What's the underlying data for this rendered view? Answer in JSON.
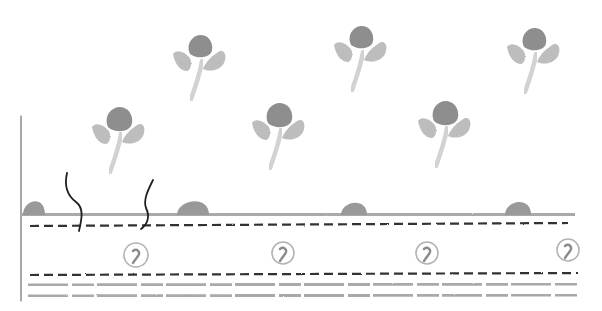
{
  "canvas": {
    "width": 602,
    "height": 311,
    "background": "#ffffff"
  },
  "colors": {
    "pencil_gray": "#a9a9a9",
    "head_gray": "#8e8e8e",
    "leaf_gray": "#bdbdbd",
    "stem_gray": "#d2d2d2",
    "dash_dark": "#333333",
    "wave_dark": "#1f1f1f",
    "ring_gray": "#b3b3b3",
    "mound_gray": "#999999"
  },
  "axis": {
    "x": 21,
    "y_top": 52,
    "y_bottom": 300,
    "gap_y": [
      110,
      117
    ]
  },
  "surface": {
    "y": 214,
    "x_start": 22,
    "x_end": 575
  },
  "band": {
    "top_dash_y": 226,
    "bottom_dash_y": 275,
    "left_x": 30,
    "right_x": 578,
    "left_dash_x": 30
  },
  "bottom_lines": [
    285,
    296
  ],
  "flowers": [
    {
      "cx": 200,
      "cy": 47,
      "r": 12
    },
    {
      "cx": 361,
      "cy": 38,
      "r": 12
    },
    {
      "cx": 534,
      "cy": 40,
      "r": 12
    },
    {
      "cx": 119,
      "cy": 120,
      "r": 13
    },
    {
      "cx": 279,
      "cy": 116,
      "r": 13
    },
    {
      "cx": 445,
      "cy": 114,
      "r": 13
    }
  ],
  "mounds": [
    {
      "cx": 34,
      "w": 22,
      "h": 18
    },
    {
      "cx": 193,
      "w": 32,
      "h": 18
    },
    {
      "cx": 354,
      "w": 26,
      "h": 16
    },
    {
      "cx": 518,
      "w": 26,
      "h": 17
    }
  ],
  "rings": [
    {
      "cx": 136,
      "cy": 255,
      "r": 12
    },
    {
      "cx": 283,
      "cy": 253,
      "r": 11
    },
    {
      "cx": 427,
      "cy": 253,
      "r": 11
    },
    {
      "cx": 568,
      "cy": 250,
      "r": 11
    }
  ],
  "wavy_lines": [
    "M67 173 C64 186, 68 196, 76 202 C84 208, 82 218, 79 231",
    "M153 180 C148 190, 143 200, 146 208 C150 216, 148 224, 141 229"
  ]
}
